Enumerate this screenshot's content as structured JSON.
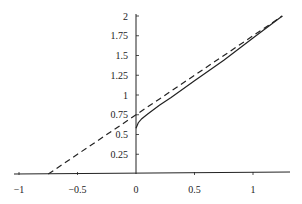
{
  "chart_data": {
    "type": "line",
    "title": "",
    "xlabel": "",
    "ylabel": "",
    "xlim": [
      -1.1,
      1.4
    ],
    "ylim": [
      0,
      2.05
    ],
    "grid": false,
    "legend": null,
    "x_ticks": [
      -1,
      -0.5,
      0,
      0.5,
      1
    ],
    "x_tick_labels": [
      "−1",
      "−0.5",
      "0",
      "0.5",
      "1"
    ],
    "y_ticks": [
      0.25,
      0.5,
      0.75,
      1,
      1.25,
      1.5,
      1.75,
      2
    ],
    "y_tick_labels": [
      "0.25",
      "0.5",
      "0.75",
      "1",
      "1.25",
      "1.5",
      "1.75",
      "2"
    ],
    "series": [
      {
        "name": "asymptote",
        "style": "dashed",
        "color": "#222222",
        "x": [
          -0.75,
          -0.5,
          0,
          0.5,
          1,
          1.25
        ],
        "y": [
          0,
          0.25,
          0.75,
          1.25,
          1.75,
          2.0
        ]
      },
      {
        "name": "curve",
        "style": "solid",
        "color": "#222222",
        "x": [
          0,
          0.02,
          0.05,
          0.1,
          0.2,
          0.3,
          0.5,
          0.75,
          1.0,
          1.25
        ],
        "y": [
          0.58,
          0.65,
          0.7,
          0.76,
          0.87,
          0.97,
          1.18,
          1.44,
          1.72,
          2.0
        ]
      }
    ]
  }
}
